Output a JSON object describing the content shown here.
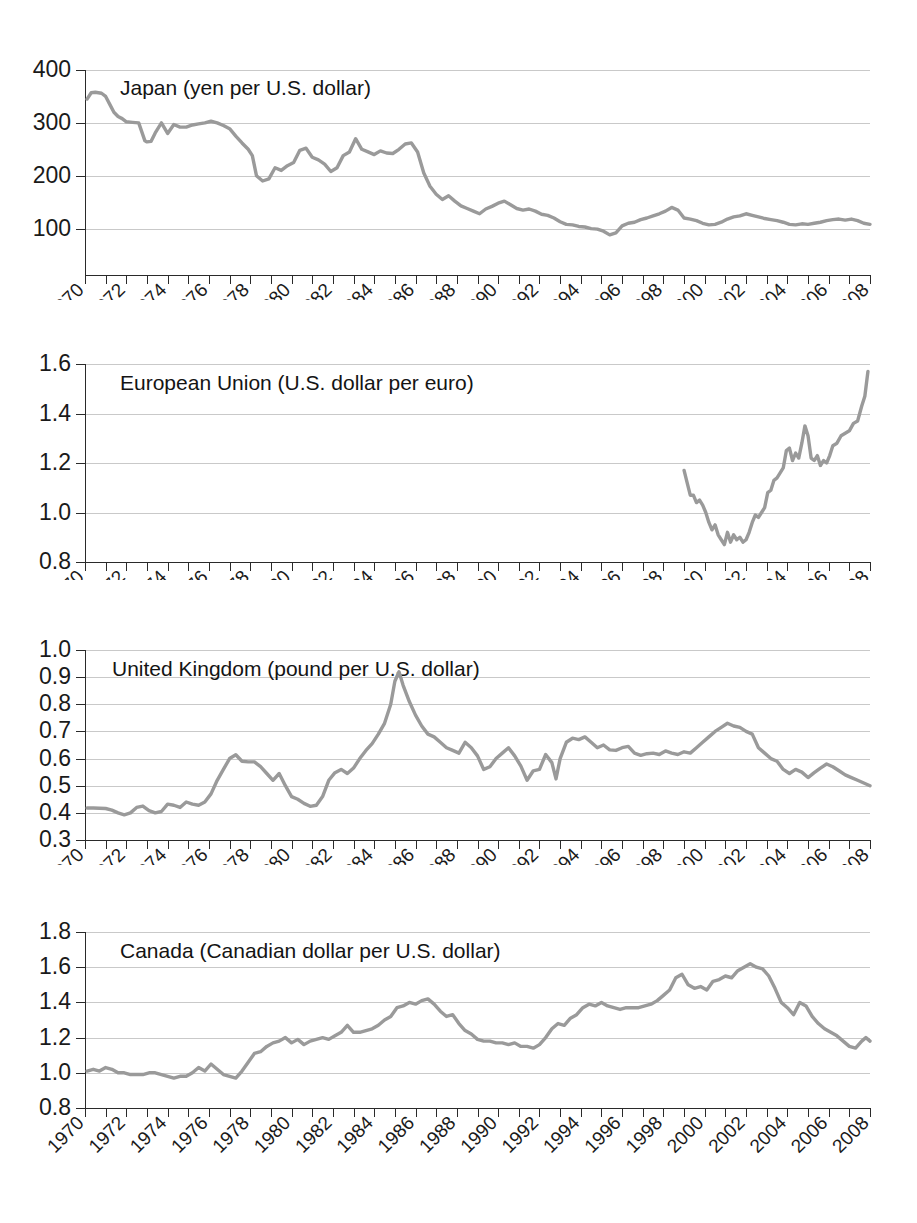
{
  "figure": {
    "background": "#ffffff",
    "line_color": "#9a9a9a",
    "grid_color": "#c9c9c9",
    "axis_color": "#2a2a2a",
    "width": 917,
    "height": 1223
  },
  "chart_data": [
    {
      "type": "line",
      "title": "Japan (yen per U.S. dollar)",
      "xlabel": "",
      "ylabel": "",
      "grid": true,
      "legend": "none",
      "xlim": [
        1970,
        2008
      ],
      "ylim": [
        50,
        400
      ],
      "yticks": [
        100,
        200,
        300,
        400
      ],
      "ytick_labels": [
        "100",
        "200",
        "300",
        "400"
      ],
      "xticks": [
        1970,
        1971,
        1972,
        1973,
        1974,
        1975,
        1976,
        1977,
        1978,
        1979,
        1980,
        1981,
        1982,
        1983,
        1984,
        1985,
        1986,
        1987,
        1988,
        1989,
        1990,
        1991,
        1992,
        1993,
        1994,
        1995,
        1996,
        1997,
        1998,
        1999,
        2000,
        2001,
        2002,
        2003,
        2004,
        2005,
        2006,
        2007,
        2008
      ],
      "xtick_labels": [
        "1970",
        "1972",
        "1974",
        "1976",
        "1978",
        "1980",
        "1982",
        "1984",
        "1986",
        "1988",
        "1990",
        "1992",
        "1994",
        "1996",
        "1998",
        "2000",
        "2002",
        "2004",
        "2006",
        "2008"
      ],
      "xtick_label_years": [
        1970,
        1972,
        1974,
        1976,
        1978,
        1980,
        1982,
        1984,
        1986,
        1988,
        1990,
        1992,
        1994,
        1996,
        1998,
        2000,
        2002,
        2004,
        2006,
        2008
      ],
      "x": [
        1970.1,
        1970.3,
        1970.5,
        1970.8,
        1971.0,
        1971.2,
        1971.4,
        1971.6,
        1971.8,
        1972.0,
        1972.3,
        1972.6,
        1972.9,
        1973.0,
        1973.2,
        1973.4,
        1973.7,
        1974.0,
        1974.3,
        1974.6,
        1974.9,
        1975.2,
        1975.5,
        1975.8,
        1976.1,
        1976.4,
        1976.7,
        1977.0,
        1977.3,
        1977.6,
        1977.9,
        1978.1,
        1978.3,
        1978.6,
        1978.9,
        1979.2,
        1979.5,
        1979.8,
        1980.1,
        1980.4,
        1980.7,
        1981.0,
        1981.3,
        1981.6,
        1981.9,
        1982.2,
        1982.5,
        1982.8,
        1983.1,
        1983.4,
        1983.7,
        1984.0,
        1984.3,
        1984.6,
        1984.9,
        1985.2,
        1985.5,
        1985.8,
        1986.1,
        1986.4,
        1986.7,
        1987.0,
        1987.3,
        1987.6,
        1987.9,
        1988.2,
        1988.5,
        1988.8,
        1989.1,
        1989.4,
        1989.7,
        1990.0,
        1990.3,
        1990.6,
        1990.9,
        1991.2,
        1991.5,
        1991.8,
        1992.1,
        1992.4,
        1992.7,
        1993.0,
        1993.3,
        1993.6,
        1993.9,
        1994.2,
        1994.5,
        1994.8,
        1995.1,
        1995.4,
        1995.7,
        1996.0,
        1996.3,
        1996.6,
        1996.9,
        1997.2,
        1997.5,
        1997.8,
        1998.1,
        1998.4,
        1998.7,
        1999.0,
        1999.3,
        1999.6,
        1999.9,
        2000.2,
        2000.5,
        2000.8,
        2001.1,
        2001.4,
        2001.7,
        2002.0,
        2002.3,
        2002.6,
        2002.9,
        2003.2,
        2003.5,
        2003.8,
        2004.1,
        2004.4,
        2004.7,
        2005.0,
        2005.3,
        2005.6,
        2005.9,
        2006.2,
        2006.5,
        2006.8,
        2007.1,
        2007.4,
        2007.7,
        2008.0
      ],
      "y": [
        345,
        357,
        358,
        356,
        350,
        335,
        320,
        312,
        308,
        302,
        301,
        300,
        266,
        264,
        265,
        281,
        300,
        280,
        297,
        292,
        292,
        296,
        298,
        300,
        303,
        300,
        295,
        289,
        275,
        262,
        250,
        238,
        200,
        190,
        194,
        215,
        210,
        219,
        225,
        248,
        252,
        235,
        230,
        222,
        208,
        215,
        238,
        245,
        270,
        250,
        245,
        240,
        247,
        243,
        242,
        250,
        260,
        262,
        245,
        205,
        180,
        165,
        155,
        162,
        152,
        143,
        138,
        133,
        128,
        137,
        142,
        148,
        152,
        145,
        138,
        135,
        137,
        133,
        127,
        125,
        120,
        113,
        108,
        107,
        104,
        103,
        100,
        99,
        95,
        88,
        92,
        105,
        110,
        112,
        117,
        120,
        124,
        128,
        133,
        140,
        135,
        120,
        118,
        115,
        110,
        107,
        108,
        112,
        118,
        122,
        124,
        128,
        125,
        122,
        119,
        117,
        115,
        112,
        108,
        107,
        109,
        108,
        110,
        112,
        115,
        117,
        118,
        116,
        118,
        115,
        110,
        108
      ]
    },
    {
      "type": "line",
      "title": "European Union (U.S. dollar per euro)",
      "xlabel": "",
      "ylabel": "",
      "grid": true,
      "legend": "none",
      "xlim": [
        1970,
        2008
      ],
      "ylim": [
        0.8,
        1.6
      ],
      "yticks": [
        0.8,
        1.0,
        1.2,
        1.4,
        1.6
      ],
      "ytick_labels": [
        "0.8",
        "1.0",
        "1.2",
        "1.4",
        "1.6"
      ],
      "xtick_labels": [
        "1970",
        "1972",
        "1974",
        "1976",
        "1978",
        "1980",
        "1982",
        "1984",
        "1986",
        "1988",
        "1990",
        "1992",
        "1994",
        "1996",
        "1998",
        "2000",
        "2002",
        "2004",
        "2006",
        "2008"
      ],
      "xtick_label_years": [
        1970,
        1972,
        1974,
        1976,
        1978,
        1980,
        1982,
        1984,
        1986,
        1988,
        1990,
        1992,
        1994,
        1996,
        1998,
        2000,
        2002,
        2004,
        2006,
        2008
      ],
      "x": [
        1999.0,
        1999.15,
        1999.3,
        1999.45,
        1999.6,
        1999.75,
        1999.9,
        2000.05,
        2000.2,
        2000.35,
        2000.5,
        2000.65,
        2000.8,
        2000.95,
        2001.1,
        2001.25,
        2001.4,
        2001.55,
        2001.7,
        2001.85,
        2002.0,
        2002.15,
        2002.3,
        2002.45,
        2002.6,
        2002.75,
        2002.9,
        2003.05,
        2003.2,
        2003.35,
        2003.5,
        2003.65,
        2003.8,
        2003.95,
        2004.1,
        2004.25,
        2004.4,
        2004.55,
        2004.7,
        2004.85,
        2005.0,
        2005.15,
        2005.3,
        2005.45,
        2005.6,
        2005.75,
        2005.9,
        2006.05,
        2006.2,
        2006.4,
        2006.6,
        2006.8,
        2007.0,
        2007.2,
        2007.4,
        2007.6,
        2007.75,
        2007.9
      ],
      "y": [
        1.17,
        1.12,
        1.07,
        1.07,
        1.04,
        1.05,
        1.03,
        1.0,
        0.96,
        0.93,
        0.95,
        0.91,
        0.89,
        0.87,
        0.92,
        0.88,
        0.91,
        0.89,
        0.9,
        0.88,
        0.89,
        0.92,
        0.96,
        0.99,
        0.98,
        1.0,
        1.02,
        1.08,
        1.09,
        1.13,
        1.14,
        1.16,
        1.18,
        1.25,
        1.26,
        1.21,
        1.24,
        1.22,
        1.28,
        1.35,
        1.31,
        1.22,
        1.21,
        1.23,
        1.19,
        1.21,
        1.2,
        1.23,
        1.27,
        1.28,
        1.31,
        1.32,
        1.33,
        1.36,
        1.37,
        1.43,
        1.47,
        1.57
      ]
    },
    {
      "type": "line",
      "title": "United Kingdom (pound per U.S. dollar)",
      "xlabel": "",
      "ylabel": "",
      "grid": true,
      "legend": "none",
      "xlim": [
        1970,
        2008
      ],
      "ylim": [
        0.3,
        1.0
      ],
      "yticks": [
        0.3,
        0.4,
        0.5,
        0.6,
        0.7,
        0.8,
        0.9,
        1.0
      ],
      "ytick_labels": [
        "0.3",
        "0.4",
        "0.5",
        "0.6",
        "0.7",
        "0.8",
        "0.9",
        "1.0"
      ],
      "xtick_labels": [
        "1970",
        "1972",
        "1974",
        "1976",
        "1978",
        "1980",
        "1982",
        "1984",
        "1986",
        "1988",
        "1990",
        "1992",
        "1994",
        "1996",
        "1998",
        "2000",
        "2002",
        "2004",
        "2006",
        "2008"
      ],
      "xtick_label_years": [
        1970,
        1972,
        1974,
        1976,
        1978,
        1980,
        1982,
        1984,
        1986,
        1988,
        1990,
        1992,
        1994,
        1996,
        1998,
        2000,
        2002,
        2004,
        2006,
        2008
      ],
      "x": [
        1970.1,
        1970.4,
        1970.7,
        1971.0,
        1971.3,
        1971.6,
        1971.9,
        1972.2,
        1972.5,
        1972.8,
        1973.1,
        1973.4,
        1973.7,
        1974.0,
        1974.3,
        1974.6,
        1974.9,
        1975.2,
        1975.5,
        1975.8,
        1976.1,
        1976.4,
        1976.7,
        1977.0,
        1977.3,
        1977.6,
        1977.9,
        1978.2,
        1978.5,
        1978.8,
        1979.1,
        1979.4,
        1979.7,
        1980.0,
        1980.3,
        1980.6,
        1980.9,
        1981.2,
        1981.5,
        1981.8,
        1982.1,
        1982.4,
        1982.7,
        1983.0,
        1983.3,
        1983.6,
        1983.9,
        1984.2,
        1984.5,
        1984.8,
        1985.0,
        1985.2,
        1985.4,
        1985.7,
        1986.0,
        1986.3,
        1986.6,
        1986.9,
        1987.2,
        1987.5,
        1987.8,
        1988.1,
        1988.4,
        1988.7,
        1989.0,
        1989.3,
        1989.6,
        1989.9,
        1990.2,
        1990.5,
        1990.8,
        1991.1,
        1991.4,
        1991.7,
        1992.0,
        1992.3,
        1992.6,
        1992.8,
        1993.0,
        1993.3,
        1993.6,
        1993.9,
        1994.2,
        1994.5,
        1994.8,
        1995.1,
        1995.4,
        1995.7,
        1996.0,
        1996.3,
        1996.6,
        1996.9,
        1997.2,
        1997.5,
        1997.8,
        1998.1,
        1998.4,
        1998.7,
        1999.0,
        1999.3,
        1999.6,
        1999.9,
        2000.2,
        2000.5,
        2000.8,
        2001.1,
        2001.4,
        2001.7,
        2002.0,
        2002.3,
        2002.6,
        2002.9,
        2003.2,
        2003.5,
        2003.8,
        2004.1,
        2004.4,
        2004.7,
        2005.0,
        2005.3,
        2005.6,
        2005.9,
        2006.2,
        2006.5,
        2006.8,
        2007.1,
        2007.4,
        2007.7,
        2008.0
      ],
      "y": [
        0.418,
        0.418,
        0.417,
        0.416,
        0.41,
        0.4,
        0.393,
        0.4,
        0.42,
        0.425,
        0.408,
        0.4,
        0.405,
        0.432,
        0.428,
        0.42,
        0.44,
        0.432,
        0.428,
        0.44,
        0.47,
        0.52,
        0.56,
        0.6,
        0.614,
        0.59,
        0.588,
        0.588,
        0.57,
        0.545,
        0.52,
        0.545,
        0.5,
        0.46,
        0.45,
        0.435,
        0.424,
        0.428,
        0.46,
        0.52,
        0.548,
        0.56,
        0.545,
        0.565,
        0.6,
        0.63,
        0.655,
        0.69,
        0.73,
        0.8,
        0.885,
        0.92,
        0.87,
        0.81,
        0.76,
        0.72,
        0.69,
        0.68,
        0.66,
        0.64,
        0.63,
        0.62,
        0.66,
        0.64,
        0.61,
        0.56,
        0.57,
        0.6,
        0.62,
        0.64,
        0.61,
        0.572,
        0.52,
        0.555,
        0.56,
        0.615,
        0.585,
        0.525,
        0.6,
        0.66,
        0.675,
        0.67,
        0.68,
        0.66,
        0.64,
        0.65,
        0.632,
        0.63,
        0.64,
        0.645,
        0.62,
        0.612,
        0.618,
        0.62,
        0.615,
        0.628,
        0.62,
        0.615,
        0.625,
        0.62,
        0.64,
        0.66,
        0.68,
        0.7,
        0.715,
        0.73,
        0.72,
        0.715,
        0.7,
        0.69,
        0.64,
        0.62,
        0.6,
        0.59,
        0.56,
        0.545,
        0.56,
        0.55,
        0.53,
        0.548,
        0.565,
        0.58,
        0.57,
        0.555,
        0.54,
        0.53,
        0.52,
        0.51,
        0.5,
        0.515,
        0.512
      ]
    },
    {
      "type": "line",
      "title": "Canada (Canadian dollar per U.S. dollar)",
      "xlabel": "",
      "ylabel": "",
      "grid": true,
      "legend": "none",
      "xlim": [
        1970,
        2008
      ],
      "ylim": [
        0.8,
        1.8
      ],
      "yticks": [
        0.8,
        1.0,
        1.2,
        1.4,
        1.6,
        1.8
      ],
      "ytick_labels": [
        "0.8",
        "1.0",
        "1.2",
        "1.4",
        "1.6",
        "1.8"
      ],
      "xtick_labels": [
        "1970",
        "1972",
        "1974",
        "1976",
        "1978",
        "1980",
        "1982",
        "1984",
        "1986",
        "1988",
        "1990",
        "1992",
        "1994",
        "1996",
        "1998",
        "2000",
        "2002",
        "2004",
        "2006",
        "2008"
      ],
      "xtick_label_years": [
        1970,
        1972,
        1974,
        1976,
        1978,
        1980,
        1982,
        1984,
        1986,
        1988,
        1990,
        1992,
        1994,
        1996,
        1998,
        2000,
        2002,
        2004,
        2006,
        2008
      ],
      "x": [
        1970.1,
        1970.4,
        1970.7,
        1971.0,
        1971.3,
        1971.6,
        1971.9,
        1972.2,
        1972.5,
        1972.8,
        1973.1,
        1973.4,
        1973.7,
        1974.0,
        1974.3,
        1974.6,
        1974.9,
        1975.2,
        1975.5,
        1975.8,
        1976.1,
        1976.4,
        1976.7,
        1977.0,
        1977.3,
        1977.6,
        1977.9,
        1978.2,
        1978.5,
        1978.8,
        1979.1,
        1979.4,
        1979.7,
        1980.0,
        1980.3,
        1980.6,
        1980.9,
        1981.2,
        1981.5,
        1981.8,
        1982.1,
        1982.4,
        1982.7,
        1983.0,
        1983.3,
        1983.6,
        1983.9,
        1984.2,
        1984.5,
        1984.8,
        1985.1,
        1985.4,
        1985.7,
        1986.0,
        1986.3,
        1986.6,
        1986.9,
        1987.2,
        1987.5,
        1987.8,
        1988.1,
        1988.4,
        1988.7,
        1989.0,
        1989.3,
        1989.6,
        1989.9,
        1990.2,
        1990.5,
        1990.8,
        1991.1,
        1991.4,
        1991.7,
        1992.0,
        1992.3,
        1992.6,
        1992.9,
        1993.2,
        1993.5,
        1993.8,
        1994.1,
        1994.4,
        1994.7,
        1995.0,
        1995.3,
        1995.6,
        1995.9,
        1996.2,
        1996.5,
        1996.8,
        1997.1,
        1997.4,
        1997.7,
        1998.0,
        1998.3,
        1998.6,
        1998.9,
        1999.2,
        1999.5,
        1999.8,
        2000.1,
        2000.4,
        2000.7,
        2001.0,
        2001.3,
        2001.6,
        2001.9,
        2002.2,
        2002.5,
        2002.8,
        2003.1,
        2003.4,
        2003.7,
        2004.0,
        2004.3,
        2004.6,
        2004.9,
        2005.2,
        2005.5,
        2005.8,
        2006.1,
        2006.4,
        2006.7,
        2007.0,
        2007.3,
        2007.6,
        2007.8,
        2008.0
      ],
      "y": [
        1.01,
        1.02,
        1.01,
        1.03,
        1.02,
        1.0,
        1.0,
        0.99,
        0.99,
        0.99,
        1.0,
        1.0,
        0.99,
        0.98,
        0.97,
        0.98,
        0.98,
        1.0,
        1.03,
        1.01,
        1.05,
        1.02,
        0.99,
        0.98,
        0.97,
        1.01,
        1.06,
        1.11,
        1.12,
        1.15,
        1.17,
        1.18,
        1.2,
        1.17,
        1.19,
        1.16,
        1.18,
        1.19,
        1.2,
        1.19,
        1.21,
        1.23,
        1.27,
        1.23,
        1.23,
        1.24,
        1.25,
        1.27,
        1.3,
        1.32,
        1.37,
        1.38,
        1.4,
        1.39,
        1.41,
        1.42,
        1.39,
        1.35,
        1.32,
        1.33,
        1.28,
        1.24,
        1.22,
        1.19,
        1.18,
        1.18,
        1.17,
        1.17,
        1.16,
        1.17,
        1.15,
        1.15,
        1.14,
        1.16,
        1.2,
        1.25,
        1.28,
        1.27,
        1.31,
        1.33,
        1.37,
        1.39,
        1.38,
        1.4,
        1.38,
        1.37,
        1.36,
        1.37,
        1.37,
        1.37,
        1.38,
        1.39,
        1.41,
        1.44,
        1.47,
        1.54,
        1.56,
        1.5,
        1.48,
        1.49,
        1.47,
        1.52,
        1.53,
        1.55,
        1.54,
        1.58,
        1.6,
        1.62,
        1.6,
        1.59,
        1.55,
        1.48,
        1.4,
        1.37,
        1.33,
        1.4,
        1.38,
        1.32,
        1.28,
        1.25,
        1.23,
        1.21,
        1.18,
        1.15,
        1.14,
        1.18,
        1.2,
        1.18,
        0.99,
        1.02
      ]
    }
  ]
}
